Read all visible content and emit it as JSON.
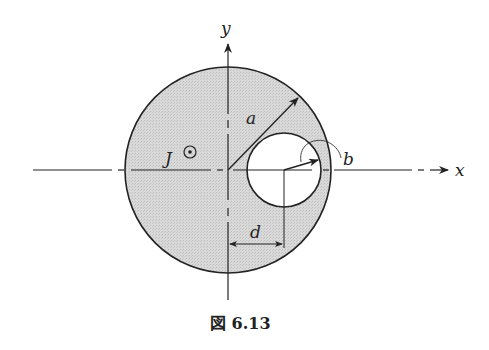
{
  "figure": {
    "caption": "図 6.13",
    "caption_prefix": "図",
    "caption_number": "6.13"
  },
  "labels": {
    "x_axis": "x",
    "y_axis": "y",
    "radius_large": "a",
    "radius_small": "b",
    "offset": "d",
    "current": "J"
  },
  "icons": {
    "current_direction": "dot-in-circle (out of page)"
  },
  "colors": {
    "fill": "#d6d6d6",
    "stroke": "#222222",
    "hole": "#ffffff"
  }
}
